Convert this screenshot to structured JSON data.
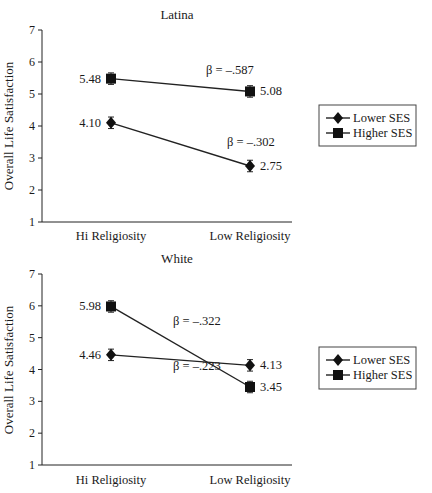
{
  "chart_data": [
    {
      "type": "line",
      "title": "Latina",
      "xlabel": "",
      "ylabel": "Overall Life Satisfaction",
      "categories": [
        "Hi Religiosity",
        "Low Religiosity"
      ],
      "ylim": [
        1,
        7
      ],
      "yticks": [
        1,
        2,
        3,
        4,
        5,
        6,
        7
      ],
      "grid": false,
      "legend_position": "right",
      "series": [
        {
          "name": "Lower SES",
          "marker": "diamond",
          "values": [
            4.1,
            2.75
          ],
          "labels": [
            "4.10",
            "2.75"
          ],
          "error": 0.18,
          "beta": "β = –.587"
        },
        {
          "name": "Higher SES",
          "marker": "square",
          "values": [
            5.48,
            5.08
          ],
          "labels": [
            "5.48",
            "5.08"
          ],
          "error": 0.18,
          "beta": "β = –.302"
        }
      ]
    },
    {
      "type": "line",
      "title": "White",
      "xlabel": "",
      "ylabel": "Overall Life Satisfaction",
      "categories": [
        "Hi Religiosity",
        "Low Religiosity"
      ],
      "ylim": [
        1,
        7
      ],
      "yticks": [
        1,
        2,
        3,
        4,
        5,
        6,
        7
      ],
      "grid": false,
      "legend_position": "right",
      "series": [
        {
          "name": "Lower SES",
          "marker": "diamond",
          "values": [
            4.46,
            4.13
          ],
          "labels": [
            "4.46",
            "4.13"
          ],
          "error": 0.18,
          "beta": "β = –.223"
        },
        {
          "name": "Higher SES",
          "marker": "square",
          "values": [
            5.98,
            3.45
          ],
          "labels": [
            "5.98",
            "3.45"
          ],
          "error": 0.18,
          "beta": "β = –.322"
        }
      ]
    }
  ],
  "layout": [
    {
      "axis_x": 42,
      "y_top": 30,
      "y_bottom": 222,
      "x_right": 292,
      "x_positions": [
        111,
        250
      ],
      "title_pos": [
        177,
        19
      ],
      "ylabel_pos": [
        13,
        126
      ],
      "xtick_y": 240,
      "beta_pos": [
        [
          206,
          74
        ],
        [
          227,
          146
        ]
      ],
      "legend": {
        "x": 319,
        "y": 105,
        "w": 97,
        "h": 41
      }
    },
    {
      "axis_x": 42,
      "y_top": 274,
      "y_bottom": 465,
      "x_right": 292,
      "x_positions": [
        111,
        250
      ],
      "title_pos": [
        177,
        263
      ],
      "ylabel_pos": [
        13,
        370
      ],
      "xtick_y": 484,
      "beta_pos": [
        [
          173,
          370
        ],
        [
          173,
          325
        ]
      ],
      "legend": {
        "x": 319,
        "y": 347,
        "w": 97,
        "h": 42
      }
    }
  ],
  "colors": {
    "ink": "#222222",
    "background": "#ffffff"
  }
}
